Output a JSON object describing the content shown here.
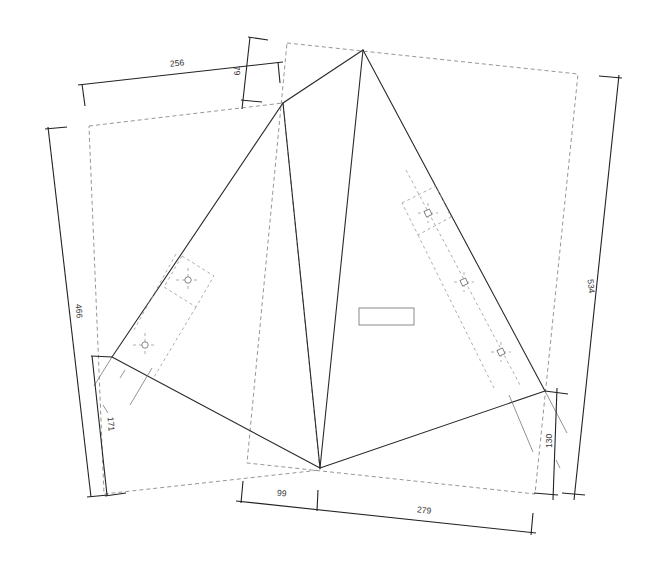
{
  "drawing": {
    "type": "roof-plan",
    "colors": {
      "ridge_lines": "#2a2a2a",
      "dimension_lines": "#222222",
      "outline_dashed": "#8a8a8a",
      "text": "#333333"
    },
    "dimensions": {
      "top_width": "256",
      "top_offset": "79",
      "left_height": "466",
      "left_lower": "171",
      "right_height": "534",
      "right_lower": "130",
      "bottom_left": "99",
      "bottom_right": "279"
    },
    "fixtures": [
      {
        "name": "left-panel-upper",
        "icon": "vent-icon"
      },
      {
        "name": "left-panel-lower",
        "icon": "vent-icon"
      },
      {
        "name": "right-panel-upper",
        "icon": "vent-icon"
      },
      {
        "name": "right-panel-middle",
        "icon": "vent-icon"
      },
      {
        "name": "right-panel-lower",
        "icon": "vent-icon"
      }
    ],
    "center_box": {
      "label": ""
    }
  }
}
